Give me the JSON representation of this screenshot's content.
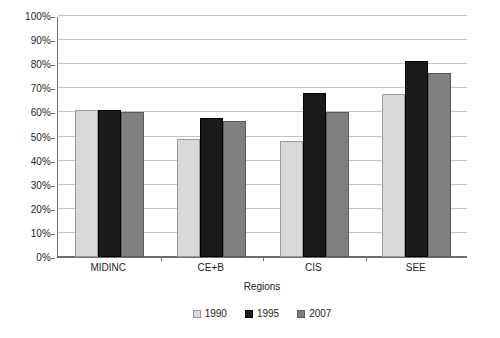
{
  "chart_data": {
    "type": "bar",
    "title": "",
    "subtitle": "",
    "xlabel": "Regions",
    "ylabel": "",
    "categories": [
      "MIDINC",
      "CE+B",
      "CIS",
      "SEE"
    ],
    "series": [
      {
        "name": "1990",
        "color": "#d9d9d9",
        "values": [
          61,
          49,
          48,
          67.5
        ]
      },
      {
        "name": "1995",
        "color": "#1a1a1a",
        "values": [
          61,
          57.5,
          68,
          81.5
        ]
      },
      {
        "name": "2007",
        "color": "#808080",
        "values": [
          60,
          56.5,
          60,
          76.5
        ]
      }
    ],
    "ylim": [
      0,
      100
    ],
    "ytick_values": [
      0,
      10,
      20,
      30,
      40,
      50,
      60,
      70,
      80,
      90,
      100
    ],
    "ytick_labels": [
      "0%",
      "10%",
      "20%",
      "30%",
      "40%",
      "50%",
      "60%",
      "70%",
      "80%",
      "90%",
      "100%"
    ],
    "value_suffix": "%",
    "grid": true,
    "grid_axis": "y",
    "legend_position": "bottom",
    "legend_entries": [
      "1990",
      "1995",
      "2007"
    ]
  },
  "axis": {
    "x_title": "Regions"
  },
  "caption": {
    "clipped_text": ""
  }
}
